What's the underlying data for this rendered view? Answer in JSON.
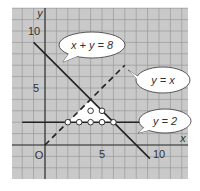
{
  "graph": {
    "x_axis_label": "x",
    "y_axis_label": "y",
    "origin_label": "O",
    "x_ticks": [
      {
        "value": 5,
        "label": "5"
      },
      {
        "value": 10,
        "label": "10"
      }
    ],
    "y_ticks": [
      {
        "value": 5,
        "label": "5"
      },
      {
        "value": 10,
        "label": "10"
      }
    ],
    "x_range": [
      -3,
      12.5
    ],
    "y_range": [
      -3,
      12
    ],
    "grid_step": 1,
    "colors": {
      "background": "#c9c9c9",
      "grid": "#9a9a9a",
      "line": "#222222",
      "region": "#ffffff"
    }
  },
  "lines": [
    {
      "name": "x-plus-y-equals-8",
      "equation": "x + y = 8",
      "style": "solid",
      "from": [
        -1,
        9
      ],
      "to": [
        9.2,
        -1.2
      ]
    },
    {
      "name": "y-equals-x",
      "equation": "y = x",
      "style": "dashed",
      "from": [
        0,
        0
      ],
      "to": [
        7,
        7
      ]
    },
    {
      "name": "y-equals-2",
      "equation": "y = 2",
      "style": "solid",
      "from": [
        -2,
        2
      ],
      "to": [
        12,
        2
      ]
    }
  ],
  "callouts": [
    {
      "text": "x + y = 8",
      "points_to": [
        1,
        7
      ]
    },
    {
      "text": "y = x",
      "points_to": [
        5.5,
        5.5
      ]
    },
    {
      "text": "y = 2",
      "points_to": [
        8,
        2
      ]
    }
  ],
  "region": {
    "vertices": [
      [
        2,
        2
      ],
      [
        4,
        4
      ],
      [
        6,
        2
      ]
    ]
  },
  "points": [
    [
      2,
      2
    ],
    [
      3,
      2
    ],
    [
      4,
      2
    ],
    [
      5,
      2
    ],
    [
      6,
      2
    ],
    [
      4,
      3
    ],
    [
      5,
      3
    ]
  ]
}
